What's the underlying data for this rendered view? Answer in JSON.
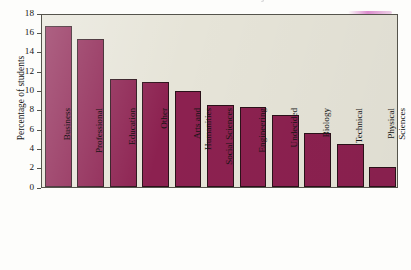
{
  "chart_data": {
    "type": "bar",
    "title": "Distribution of intended majors",
    "xlabel": "",
    "ylabel": "Percentage of students",
    "ylim": [
      0,
      18
    ],
    "ytick_step": 2,
    "yticks": [
      "18",
      "16",
      "14",
      "12",
      "10",
      "8",
      "6",
      "4",
      "2",
      "0"
    ],
    "grid": false,
    "legend": null,
    "categories": [
      "Business",
      "Professional",
      "Education",
      "Other",
      "Arts and\nHumanities",
      "Social Sciences",
      "Engineering",
      "Undecided",
      "Biology",
      "Technical",
      "Physical\nSciences"
    ],
    "values": [
      16.7,
      15.3,
      11.2,
      10.9,
      9.9,
      8.5,
      8.3,
      7.5,
      5.6,
      4.4,
      2.1
    ]
  },
  "style": {
    "bar_fill": "#8c2150",
    "bar_edge": "#2b1119",
    "plot_background": "#e6e4d8",
    "axis_color": "#55544c",
    "page_background": "#fdfdfb",
    "text_color": "#141414"
  }
}
